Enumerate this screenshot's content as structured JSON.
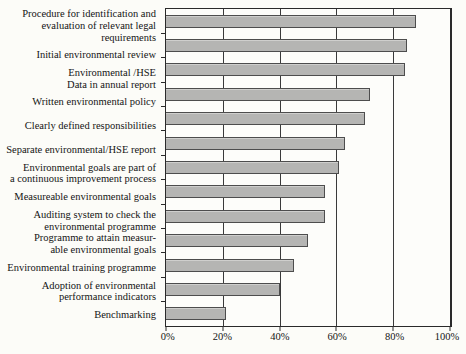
{
  "figure": {
    "bar_fill_color": "#b5b5b3",
    "bar_border_color": "#4d4d4d",
    "axis_color": "#2a2a2a",
    "background_color": "#fcfcf8"
  },
  "chart_data": {
    "type": "bar",
    "orientation": "horizontal",
    "title": "",
    "xlabel": "",
    "ylabel": "",
    "xlim": [
      0,
      100
    ],
    "grid": true,
    "legend": false,
    "categories": [
      "Procedure for identification and\nevaluation of relevant legal  requirements",
      "Initial  environmental review",
      "Environmental /HSE\nData in annual report",
      "Written environmental policy",
      "Clearly defined responsibilities",
      "Separate  environmental/HSE report",
      "Environmental goals are part of\na continuous improvement process",
      "Measureable  environmental goals",
      "Auditing  system to check the\nenvironmental  programme",
      "Programme to attain measur-\nable environmental goals",
      "Environmental training  programme",
      "Adoption of environmental\nperformance indicators",
      "Benchmarking"
    ],
    "values": [
      88,
      85,
      84,
      72,
      70,
      63,
      61,
      56,
      56,
      50,
      45,
      40,
      21
    ],
    "unit": "%",
    "xtick_labels": [
      "0%",
      "20%",
      "40%",
      "60%",
      "80%",
      "100%"
    ],
    "xtick_values": [
      0,
      20,
      40,
      60,
      80,
      100
    ]
  }
}
